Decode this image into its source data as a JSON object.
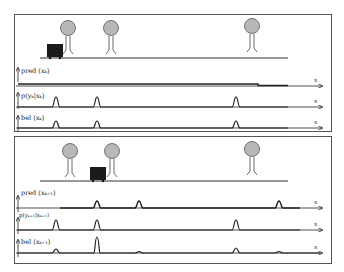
{
  "figure": {
    "colors": {
      "landmark_fill": "#b8b8b8",
      "line": "#222222",
      "robot": "#1a1a1a",
      "border": "#555555"
    }
  },
  "panels": [
    {
      "id": "top",
      "landmarks_x": [
        68,
        111,
        252
      ],
      "robot_x": 47,
      "plots": [
        {
          "label": "pred (x_k)",
          "axis_label": "x",
          "shape": "uniform"
        },
        {
          "label": "p(y_k | x_k)",
          "axis_label": "x",
          "peaks_x": [
            56,
            97,
            236
          ]
        },
        {
          "label": "bel (x_k)",
          "axis_label": "x",
          "peaks_x": [
            56,
            97,
            236
          ]
        }
      ]
    },
    {
      "id": "bottom",
      "landmarks_x": [
        70,
        112,
        252
      ],
      "robot_x": 90,
      "plots": [
        {
          "label": "pred (x_{k+1})",
          "axis_label": "x",
          "peaks_x": [
            97,
            139,
            279
          ]
        },
        {
          "label": "p(y_{k+1} | x_{k+1})",
          "axis_label": "x",
          "peaks_x": [
            56,
            97,
            236
          ]
        },
        {
          "label": "bel (x_{k+1})",
          "axis_label": "x",
          "peaks_x": [
            56,
            97,
            139,
            236,
            279
          ]
        }
      ]
    }
  ],
  "labels": {
    "top_pred": "pred (xₖ)",
    "top_obs": "p(yₖ|xₖ)",
    "top_bel": "bel (xₖ)",
    "bot_pred": "pred (xₖ₊₁)",
    "bot_obs": "p(yₖ₊₁|xₖ₊₁)",
    "bot_bel": "bel (xₖ₊₁)",
    "x_axis": "x"
  }
}
